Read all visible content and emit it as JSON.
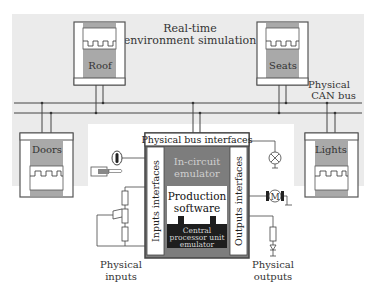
{
  "diagram": {
    "title_line1": "Real-time",
    "title_line2": "environment simulation",
    "bus_label_line1": "Physical",
    "bus_label_line2": "CAN bus",
    "nodes": {
      "roof": "Roof",
      "seats": "Seats",
      "doors": "Doors",
      "lights": "Lights"
    },
    "ecu": {
      "bus_interfaces": "Physical bus interfaces",
      "in_circuit_line1": "In-circuit",
      "in_circuit_line2": "emulator",
      "production_line1": "Production",
      "production_line2": "software",
      "cpu_line1": "Central",
      "cpu_line2": "processor unit",
      "cpu_line3": "emulator",
      "inputs_interfaces": "Inputs interfaces",
      "outputs_interfaces": "Outputs interfaces"
    },
    "inputs_label_line1": "Physical",
    "inputs_label_line2": "inputs",
    "outputs_label_line1": "Physical",
    "outputs_label_line2": "outputs",
    "motor_symbol": "M",
    "colors": {
      "background_grey": "#ebebeb",
      "node_grey": "#a9a9a9",
      "ecu_grey": "#7d7d7d",
      "cpu_dark": "#1e1e1e",
      "line": "#444444"
    }
  }
}
